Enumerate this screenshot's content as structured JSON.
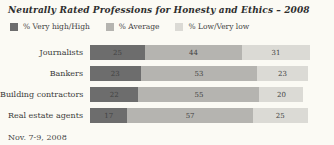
{
  "title": "Neutrally Rated Professions for Honesty and Ethics – 2008",
  "footer": "Nov. 7-9, 2008",
  "chart_data": {
    "type": "bar",
    "orientation": "horizontal-stacked",
    "title": "Neutrally Rated Professions for Honesty and Ethics – 2008",
    "categories": [
      "Journalists",
      "Bankers",
      "Building contractors",
      "Real estate agents"
    ],
    "series": [
      {
        "name": "% Very high/High",
        "color": "#6d6d6d",
        "values": [
          25,
          23,
          22,
          17
        ]
      },
      {
        "name": "% Average",
        "color": "#b5b4b0",
        "values": [
          44,
          53,
          55,
          57
        ]
      },
      {
        "name": "% Low/Very low",
        "color": "#dbdad5",
        "values": [
          31,
          23,
          20,
          25
        ]
      }
    ],
    "xlim": [
      0,
      100
    ],
    "value_labels": "inside",
    "legend_position": "top",
    "grid": false,
    "footnote": "Nov. 7-9, 2008"
  }
}
